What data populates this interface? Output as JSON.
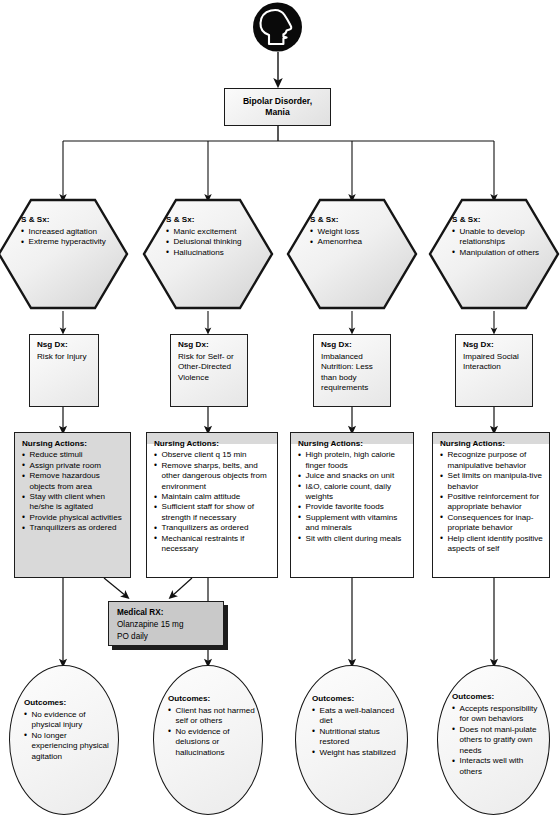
{
  "icon": {
    "name": "head-profile-icon"
  },
  "root": {
    "title_line1": "Bipolar Disorder,",
    "title_line2": "Mania"
  },
  "columns": [
    {
      "signs": {
        "heading": "S & Sx:",
        "items": [
          "Increased agitation",
          "Extreme hyperactivity"
        ]
      },
      "diagnosis": {
        "heading": "Nsg Dx:",
        "lines": [
          "Risk for Injury"
        ]
      },
      "actions": {
        "heading": "Nursing Actions:",
        "items": [
          "Reduce stimuli",
          "Assign private room",
          "Remove hazardous objects from area",
          "Stay with client when he/she is agitated",
          "Provide physical activities",
          "Tranquilizers as ordered"
        ]
      },
      "outcomes": {
        "heading": "Outcomes:",
        "items": [
          "No evidence of physical injury",
          "No longer experiencing physical agitation"
        ]
      }
    },
    {
      "signs": {
        "heading": "S & Sx:",
        "items": [
          "Manic excitement",
          "Delusional thinking",
          "Hallucinations"
        ]
      },
      "diagnosis": {
        "heading": "Nsg Dx:",
        "lines": [
          "Risk for Self- or",
          "Other-Directed",
          "Violence"
        ]
      },
      "actions": {
        "heading": "Nursing Actions:",
        "items": [
          "Observe client q 15 min",
          "Remove sharps, belts, and other dangerous objects from environment",
          "Maintain calm attitude",
          "Sufficient staff for show of strength if necessary",
          "Tranquilizers as ordered",
          "Mechanical restraints if necessary"
        ]
      },
      "outcomes": {
        "heading": "Outcomes:",
        "items": [
          "Client has not harmed self or others",
          "No evidence of delusions or hallucinations"
        ]
      }
    },
    {
      "signs": {
        "heading": "S & Sx:",
        "items": [
          "Weight loss",
          "Amenorrhea"
        ]
      },
      "diagnosis": {
        "heading": "Nsg Dx:",
        "lines": [
          "Imbalanced",
          "Nutrition: Less",
          "than body",
          "requirements"
        ]
      },
      "actions": {
        "heading": "Nursing Actions:",
        "items": [
          "High protein, high calorie finger foods",
          "Juice and snacks on unit",
          "I&O, calorie count, daily weights",
          "Provide favorite foods",
          "Supplement with vitamins and minerals",
          "Sit with client during meals"
        ]
      },
      "outcomes": {
        "heading": "Outcomes:",
        "items": [
          "Eats a well-balanced diet",
          "Nutritional status restored",
          "Weight has stabilized"
        ]
      }
    },
    {
      "signs": {
        "heading": "S & Sx:",
        "items": [
          "Unable to develop relationships",
          "Manipulation of others"
        ]
      },
      "diagnosis": {
        "heading": "Nsg Dx:",
        "lines": [
          "Impaired Social",
          "Interaction"
        ]
      },
      "actions": {
        "heading": "Nursing Actions:",
        "items": [
          "Recognize purpose of manipulative behavior",
          "Set limits on manipula-tive behavior",
          "Positive reinforcement for appropriate behavior",
          "Consequences for inap-propriate behavior",
          "Help client identify positive aspects of self"
        ]
      },
      "outcomes": {
        "heading": "Outcomes:",
        "items": [
          "Accepts responsibility for own behaviors",
          "Does not mani-pulate others to gratify own needs",
          "Interacts well with others"
        ]
      }
    }
  ],
  "medical_rx": {
    "heading": "Medical RX:",
    "line1": "Olanzapine 15 mg",
    "line2": "PO daily"
  },
  "colors": {
    "stroke": "#1d1d1d",
    "gray_fill": "#d9d9d9",
    "rx_fill": "#c9c9c9",
    "page_bg": "#ffffff"
  }
}
